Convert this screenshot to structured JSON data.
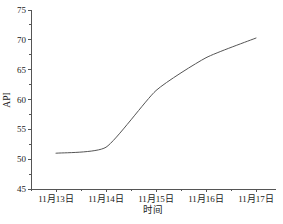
{
  "chart_data": {
    "type": "line",
    "title": "",
    "xlabel": "时间",
    "ylabel": "API",
    "categories": [
      "11月13日",
      "11月14日",
      "11月15日",
      "11月16日",
      "11月17日"
    ],
    "values": [
      51.0,
      52.0,
      61.5,
      67.0,
      70.3
    ],
    "series": [
      {
        "name": "API",
        "values": [
          51.0,
          52.0,
          61.5,
          67.0,
          70.3
        ]
      }
    ],
    "ylim": [
      45,
      75
    ],
    "ytick_labels": [
      "45",
      "50",
      "55",
      "60",
      "65",
      "70",
      "75"
    ],
    "ytick_values": [
      45,
      50,
      55,
      60,
      65,
      70,
      75
    ],
    "yminor_step": 2.5,
    "grid": false,
    "legend": false,
    "legend_position": "none",
    "line_color": "#555555",
    "line_width": 1,
    "markers": false,
    "smoothing": "slight",
    "axis_color": "#555555",
    "background_color": "#ffffff",
    "spines": [
      "left",
      "bottom"
    ],
    "tick_direction": "out"
  }
}
